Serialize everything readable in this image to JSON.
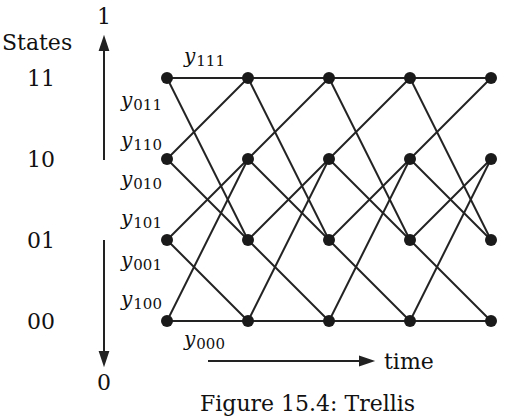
{
  "axis": {
    "title": "States",
    "top_bit": "1",
    "bottom_bit": "0",
    "time_label": "time"
  },
  "states": [
    "11",
    "10",
    "01",
    "00"
  ],
  "edge_labels": {
    "y111": {
      "base": "y",
      "sub": "111"
    },
    "y011": {
      "base": "y",
      "sub": "011"
    },
    "y110": {
      "base": "y",
      "sub": "110"
    },
    "y010": {
      "base": "y",
      "sub": "010"
    },
    "y101": {
      "base": "y",
      "sub": "101"
    },
    "y001": {
      "base": "y",
      "sub": "001"
    },
    "y100": {
      "base": "y",
      "sub": "100"
    },
    "y000": {
      "base": "y",
      "sub": "000"
    }
  },
  "caption": "Figure 15.4: Trellis",
  "trellis": {
    "time_steps": 5,
    "node_x": [
      167,
      248,
      329,
      410,
      491
    ],
    "state_y": {
      "11": 78,
      "10": 159,
      "01": 240,
      "00": 321
    },
    "transitions": [
      {
        "from": "11",
        "to": "11",
        "label": "y111"
      },
      {
        "from": "11",
        "to": "01",
        "label": "y011"
      },
      {
        "from": "10",
        "to": "11",
        "label": "y110"
      },
      {
        "from": "10",
        "to": "01",
        "label": "y010"
      },
      {
        "from": "01",
        "to": "10",
        "label": "y101"
      },
      {
        "from": "01",
        "to": "00",
        "label": "y001"
      },
      {
        "from": "00",
        "to": "10",
        "label": "y100"
      },
      {
        "from": "00",
        "to": "00",
        "label": "y000"
      }
    ]
  }
}
